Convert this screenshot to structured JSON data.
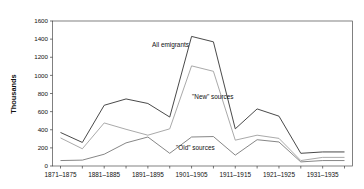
{
  "chart_data": {
    "type": "line",
    "title": "",
    "xlabel": "",
    "ylabel": "Thousands",
    "ylim": [
      0,
      1600
    ],
    "ytick_step": 200,
    "grid": false,
    "legend_position": "inline-annotations",
    "yticks": [
      "0",
      "200",
      "400",
      "600",
      "800",
      "1000",
      "1200",
      "1400",
      "1600"
    ],
    "categories": [
      "1871-1875",
      "1876-1880",
      "1881-1885",
      "1886-1890",
      "1891-1895",
      "1896-1900",
      "1901-1905",
      "1906-1910",
      "1911-1915",
      "1916-1920",
      "1921-1925",
      "1926-1930",
      "1931-1935",
      "1936-1940"
    ],
    "visible_xtick_labels": [
      "1871-1875",
      "1881-1885",
      "1891-1895",
      "1901-1905",
      "1911-1915",
      "1921-1925",
      "1931-1935"
    ],
    "series": [
      {
        "name": "All emigrants",
        "label": "All emigrants",
        "color": "#3f3f3f",
        "values": [
          370,
          260,
          670,
          740,
          690,
          540,
          1430,
          1370,
          410,
          630,
          550,
          140,
          155,
          155
        ]
      },
      {
        "name": "New sources",
        "label": "\"New\" sources",
        "color": "#9a9a9a",
        "values": [
          310,
          190,
          475,
          405,
          340,
          410,
          1105,
          1045,
          285,
          340,
          305,
          60,
          95,
          95
        ]
      },
      {
        "name": "Old sources",
        "label": "\"Old\" sources",
        "color": "#707070",
        "values": [
          60,
          65,
          130,
          255,
          320,
          140,
          320,
          325,
          120,
          290,
          265,
          45,
          60,
          60
        ]
      }
    ],
    "annotations": [
      {
        "text": "All emigrants",
        "series": "All emigrants"
      },
      {
        "text": "\"New\" sources",
        "series": "New sources"
      },
      {
        "text": "\"Old\" sources",
        "series": "Old sources"
      }
    ]
  }
}
